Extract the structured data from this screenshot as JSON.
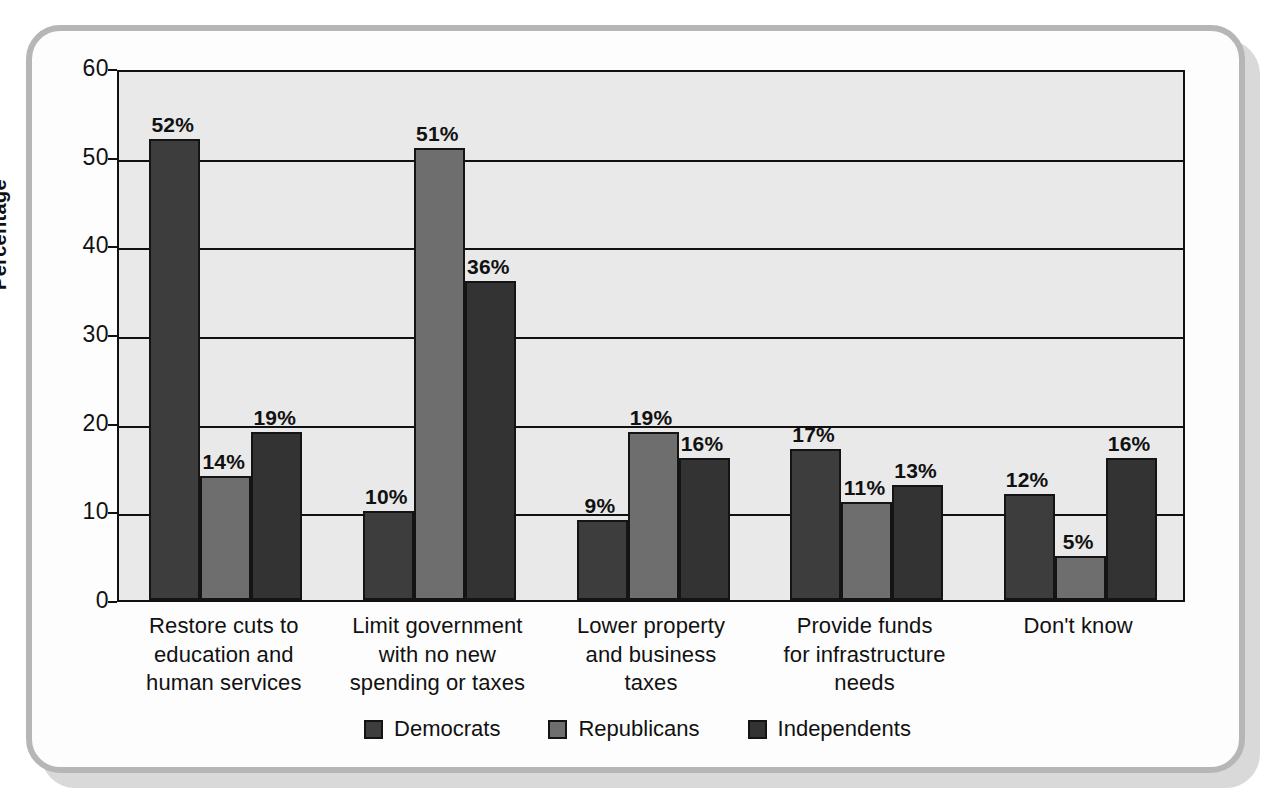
{
  "chart_data": {
    "type": "bar",
    "title": "",
    "xlabel": "",
    "ylabel": "Percentage",
    "ylim": [
      0,
      60
    ],
    "yticks": [
      "0",
      "10",
      "20",
      "30",
      "40",
      "50",
      "60"
    ],
    "grid": true,
    "legend_position": "bottom",
    "categories": [
      "Restore cuts to\neducation and\nhuman services",
      "Limit government\nwith no new\nspending or taxes",
      "Lower property\nand business\ntaxes",
      "Provide funds\nfor infrastructure\nneeds",
      "Don't know"
    ],
    "category_lines": [
      [
        "Restore cuts to",
        "education and",
        "human services"
      ],
      [
        "Limit government",
        "with no new",
        "spending or taxes"
      ],
      [
        "Lower property",
        "and business",
        "taxes"
      ],
      [
        "Provide funds",
        "for infrastructure",
        "needs"
      ],
      [
        "Don't know"
      ]
    ],
    "series": [
      {
        "name": "Democrats",
        "color": "#3d3d3d",
        "values": [
          52,
          10,
          9,
          17,
          12
        ],
        "labels": [
          "52%",
          "10%",
          "9%",
          "17%",
          "12%"
        ]
      },
      {
        "name": "Republicans",
        "color": "#6e6e6e",
        "values": [
          14,
          51,
          19,
          11,
          5
        ],
        "labels": [
          "14%",
          "51%",
          "19%",
          "11%",
          "5%"
        ]
      },
      {
        "name": "Independents",
        "color": "#333333",
        "values": [
          19,
          36,
          16,
          13,
          16
        ],
        "labels": [
          "19%",
          "36%",
          "16%",
          "13%",
          "16%"
        ]
      }
    ]
  },
  "axis": {
    "y_title": "Percentage",
    "y_ticks": [
      "60",
      "50",
      "40",
      "30",
      "20",
      "10",
      "0"
    ]
  },
  "legend": {
    "items": [
      {
        "label": "Democrats",
        "color": "#3d3d3d"
      },
      {
        "label": "Republicans",
        "color": "#6e6e6e"
      },
      {
        "label": "Independents",
        "color": "#333333"
      }
    ]
  }
}
